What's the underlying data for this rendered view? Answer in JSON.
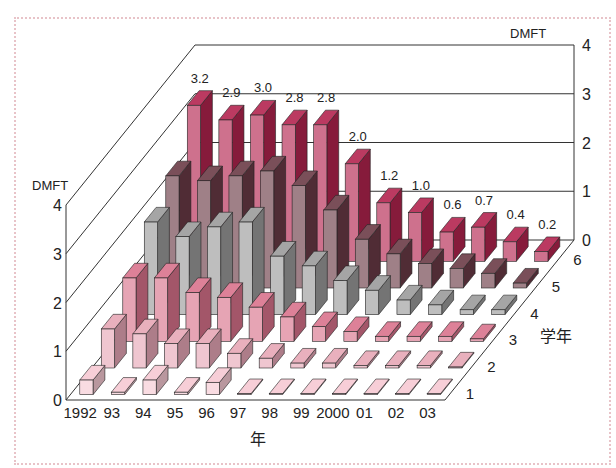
{
  "chart_data": {
    "type": "bar3d",
    "title": "",
    "xlabel": "年",
    "ylabel": "学年",
    "zlabel": "DMFT",
    "categories": [
      "1992",
      "93",
      "94",
      "95",
      "96",
      "97",
      "98",
      "99",
      "2000",
      "01",
      "02",
      "03"
    ],
    "depth_categories": [
      "1",
      "2",
      "3",
      "4",
      "5",
      "6"
    ],
    "zlim": [
      0,
      4
    ],
    "z_ticks": [
      "0",
      "1",
      "2",
      "3",
      "4"
    ],
    "series": [
      {
        "name": "1",
        "color": "#f6c9d3",
        "values": [
          0.3,
          0.05,
          0.3,
          0.05,
          0.25,
          0,
          0,
          0,
          0,
          0,
          0,
          0
        ]
      },
      {
        "name": "2",
        "color": "#e7a7b6",
        "values": [
          0.8,
          0.7,
          0.5,
          0.5,
          0.3,
          0.2,
          0.1,
          0.1,
          0.05,
          0.05,
          0.05,
          0
        ]
      },
      {
        "name": "3",
        "color": "#d9738c",
        "values": [
          1.3,
          1.3,
          1.0,
          0.9,
          0.7,
          0.5,
          0.3,
          0.2,
          0.1,
          0.1,
          0.1,
          0.05
        ]
      },
      {
        "name": "4",
        "color": "#9b9b9b",
        "values": [
          1.9,
          1.6,
          1.8,
          1.9,
          1.2,
          1.0,
          0.7,
          0.5,
          0.3,
          0.2,
          0.1,
          0.1
        ]
      },
      {
        "name": "5",
        "color": "#6b3b47",
        "values": [
          2.3,
          2.2,
          2.3,
          2.4,
          2.1,
          1.6,
          1.0,
          0.7,
          0.5,
          0.4,
          0.3,
          0.1
        ]
      },
      {
        "name": "6",
        "color": "#b3244f",
        "values": [
          3.2,
          2.9,
          3.0,
          2.8,
          2.8,
          2.0,
          1.2,
          1.0,
          0.6,
          0.7,
          0.4,
          0.2
        ]
      }
    ],
    "data_labels_series": "6",
    "data_labels": [
      "3.2",
      "2.9",
      "3.0",
      "2.8",
      "2.8",
      "2.0",
      "1.2",
      "1.0",
      "0.6",
      "0.7",
      "0.4",
      "0.2"
    ],
    "grid": true,
    "legend": "none"
  }
}
